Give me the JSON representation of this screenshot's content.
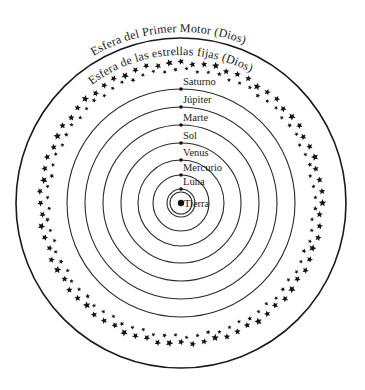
{
  "diagram": {
    "center": {
      "x": 181,
      "y": 203
    },
    "outer_sphere": {
      "label": "Esfera del Primer Motor (Dios)",
      "radius": 165,
      "label_radius": 171
    },
    "fixed_stars": {
      "label": "Esfera de las estrellas fijas (Dios)",
      "label_radius": 148,
      "star_rows": [
        {
          "radius": 140,
          "count": 76,
          "size": 3.4
        },
        {
          "radius": 133,
          "count": 76,
          "size": 2.2
        }
      ]
    },
    "spheres": [
      {
        "name": "Saturno",
        "radius": 114
      },
      {
        "name": "Júpiter",
        "radius": 96
      },
      {
        "name": "Marte",
        "radius": 78
      },
      {
        "name": "Sol",
        "radius": 60
      },
      {
        "name": "Venus",
        "radius": 43
      },
      {
        "name": "Mercurio",
        "radius": 28
      },
      {
        "name": "Luna",
        "radius": 14
      }
    ],
    "earth": {
      "name": "Tierra",
      "dot_radius": 3.2,
      "ring_radius": 11
    },
    "colors": {
      "ink": "#1a1a1a",
      "background": "#ffffff"
    }
  }
}
